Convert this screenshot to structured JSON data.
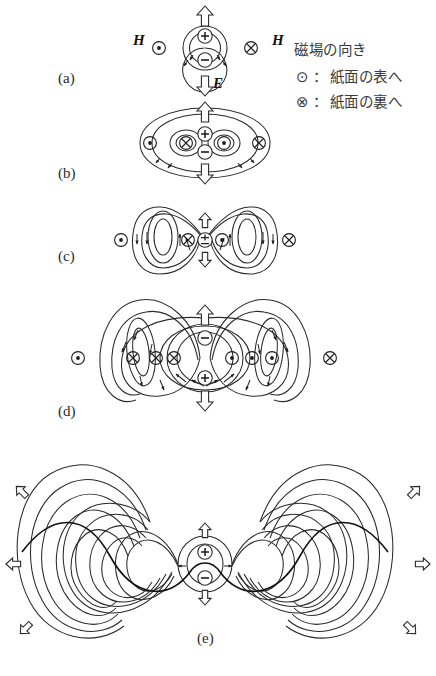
{
  "figure": {
    "background_color": "#ffffff",
    "line_color": "#2a2a2a",
    "wave_color": "#111111"
  },
  "legend": {
    "title": "磁場の向き",
    "rows": [
      {
        "symbol": "⊙",
        "separator": "：",
        "text": "紙面の表へ"
      },
      {
        "symbol": "⊗",
        "separator": "：",
        "text": "紙面の裏へ"
      }
    ]
  },
  "panels": [
    {
      "id": "a",
      "label": "(a)",
      "x": 58,
      "y": 70,
      "charges": [
        "+",
        "−"
      ],
      "field_symbols": [
        "⊙",
        "⊗"
      ]
    },
    {
      "id": "b",
      "label": "(b)",
      "x": 58,
      "y": 165,
      "charges": [
        "+",
        "−"
      ],
      "field_symbols": [
        "⊙",
        "⊗",
        "⊙",
        "⊗"
      ]
    },
    {
      "id": "c",
      "label": "(c)",
      "x": 58,
      "y": 248,
      "charges": [
        "±"
      ],
      "field_symbols": [
        "⊙",
        "⊗",
        "⊙",
        "⊗"
      ]
    },
    {
      "id": "d",
      "label": "(d)",
      "x": 58,
      "y": 403,
      "charges": [
        "−",
        "+"
      ],
      "field_symbols": [
        "⊙",
        "⊗",
        "⊗",
        "⊗",
        "⊙",
        "⊙",
        "⊙",
        "⊗"
      ]
    },
    {
      "id": "e",
      "label": "(e)",
      "x": 205,
      "y": 630,
      "charges": [
        "+",
        "−"
      ],
      "field_symbols": []
    }
  ],
  "vector_labels": [
    {
      "name": "H-left",
      "text": "H",
      "x": 133,
      "y": 32
    },
    {
      "name": "H-right",
      "text": "H",
      "x": 272,
      "y": 32
    },
    {
      "name": "E",
      "text": "E",
      "x": 213,
      "y": 75
    }
  ],
  "symbols": {
    "dot_in_circle": "⊙",
    "cross_in_circle": "⊗",
    "plus": "+",
    "minus": "−",
    "plus_minus": "±"
  }
}
